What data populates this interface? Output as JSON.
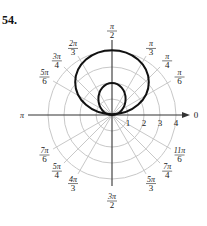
{
  "problem_number": "54.",
  "chart_data": {
    "type": "polar",
    "title": "",
    "center_px": [
      112,
      115
    ],
    "px_per_unit": 16,
    "radial_rings": [
      1,
      2,
      3,
      4
    ],
    "radial_tick_labels": [
      "1",
      "2",
      "3",
      "4"
    ],
    "angle_labels": [
      {
        "angle_deg": 0,
        "num": "0",
        "den": ""
      },
      {
        "angle_deg": 30,
        "num": "π",
        "den": "6"
      },
      {
        "angle_deg": 45,
        "num": "π",
        "den": "4"
      },
      {
        "angle_deg": 60,
        "num": "π",
        "den": "3"
      },
      {
        "angle_deg": 90,
        "num": "π",
        "den": "2"
      },
      {
        "angle_deg": 120,
        "num": "2π",
        "den": "3"
      },
      {
        "angle_deg": 135,
        "num": "3π",
        "den": "4"
      },
      {
        "angle_deg": 150,
        "num": "5π",
        "den": "6"
      },
      {
        "angle_deg": 180,
        "num": "π",
        "den": ""
      },
      {
        "angle_deg": 210,
        "num": "7π",
        "den": "6"
      },
      {
        "angle_deg": 225,
        "num": "5π",
        "den": "4"
      },
      {
        "angle_deg": 240,
        "num": "4π",
        "den": "3"
      },
      {
        "angle_deg": 270,
        "num": "3π",
        "den": "2"
      },
      {
        "angle_deg": 300,
        "num": "5π",
        "den": "3"
      },
      {
        "angle_deg": 315,
        "num": "7π",
        "den": "4"
      },
      {
        "angle_deg": 330,
        "num": "11π",
        "den": "6"
      }
    ],
    "curves": [
      {
        "name": "outer-loop",
        "description": "large loop above pole, max r≈4 at π/2, width≈4.6 units",
        "center_units": [
          0,
          2.05
        ],
        "rx_units": 2.3,
        "ry_units": 2.0
      },
      {
        "name": "inner-loop",
        "description": "small loop above pole, max r≈2 at π/2",
        "center_units": [
          0,
          1.0
        ],
        "rx_units": 0.85,
        "ry_units": 1.0
      }
    ],
    "colors": {
      "grid": "#c8c8c8",
      "axis": "#333333",
      "curve": "#111111"
    }
  }
}
